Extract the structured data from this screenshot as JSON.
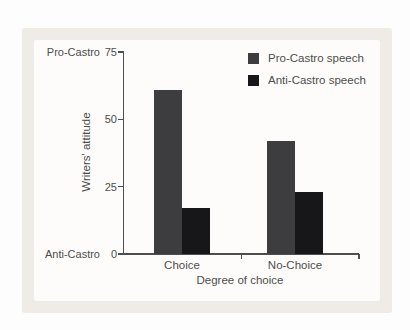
{
  "figure": {
    "panel_bg": "#efece8",
    "card_bg": "#fdfcfb",
    "text_color": "#4d4d4d",
    "axis_color": "#4e4e4e"
  },
  "chart_data": {
    "type": "bar",
    "title": "",
    "categories": [
      "Choice",
      "No-Choice"
    ],
    "series": [
      {
        "name": "Pro-Castro speech",
        "values": [
          61,
          42
        ],
        "color": "#3d3d40"
      },
      {
        "name": "Anti-Castro speech",
        "values": [
          17,
          23
        ],
        "color": "#17171a"
      }
    ],
    "xlabel": "Degree of choice",
    "ylabel": "Writers' attitude",
    "ylim": [
      0,
      75
    ],
    "yticks": [
      0,
      25,
      50,
      75
    ],
    "y_end_labels": {
      "top": "Pro-Castro",
      "bottom": "Anti-Castro"
    },
    "legend_position": "top-right",
    "grid": false
  }
}
